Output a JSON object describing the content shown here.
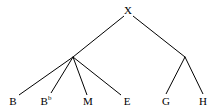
{
  "figure": {
    "type": "cladogram-tree",
    "background_color": "#ffffff",
    "line_color": "#000000",
    "text_color": "#000000",
    "line_width": 1,
    "width": 221,
    "height": 112
  },
  "nodes": {
    "root": {
      "id": "X",
      "label": "X",
      "x": 128,
      "y": 10,
      "labeled": true
    },
    "internal_left": {
      "id": "node-left",
      "label": "",
      "x": 73,
      "y": 57,
      "labeled": false
    },
    "internal_right": {
      "id": "node-right",
      "label": "",
      "x": 185,
      "y": 57,
      "labeled": false
    }
  },
  "leaves": [
    {
      "id": "B",
      "label": "B",
      "superscript": "",
      "x": 13,
      "y": 101
    },
    {
      "id": "Bb",
      "label": "B",
      "superscript": "b",
      "x": 46,
      "y": 101
    },
    {
      "id": "M",
      "label": "M",
      "superscript": "",
      "x": 88,
      "y": 101
    },
    {
      "id": "E",
      "label": "E",
      "superscript": "",
      "x": 127,
      "y": 101
    },
    {
      "id": "G",
      "label": "G",
      "superscript": "",
      "x": 166,
      "y": 101
    },
    {
      "id": "H",
      "label": "H",
      "superscript": "",
      "x": 203,
      "y": 101
    }
  ],
  "edges": [
    {
      "id": "edge-root-left",
      "from": "root",
      "to": "internal_left",
      "x1": 124,
      "y1": 16,
      "x2": 73,
      "y2": 57
    },
    {
      "id": "edge-root-right",
      "from": "root",
      "to": "internal_right",
      "x1": 133,
      "y1": 16,
      "x2": 185,
      "y2": 57
    },
    {
      "id": "edge-left-B",
      "from": "internal_left",
      "to": "B",
      "x1": 73,
      "y1": 57,
      "x2": 19,
      "y2": 95
    },
    {
      "id": "edge-left-Bb",
      "from": "internal_left",
      "to": "Bb",
      "x1": 73,
      "y1": 57,
      "x2": 51,
      "y2": 93
    },
    {
      "id": "edge-left-M",
      "from": "internal_left",
      "to": "M",
      "x1": 73,
      "y1": 57,
      "x2": 87,
      "y2": 95
    },
    {
      "id": "edge-left-E",
      "from": "internal_left",
      "to": "E",
      "x1": 73,
      "y1": 57,
      "x2": 121,
      "y2": 95
    },
    {
      "id": "edge-right-G",
      "from": "internal_right",
      "to": "G",
      "x1": 185,
      "y1": 57,
      "x2": 166,
      "y2": 94
    },
    {
      "id": "edge-right-H",
      "from": "internal_right",
      "to": "H",
      "x1": 185,
      "y1": 57,
      "x2": 203,
      "y2": 94
    }
  ]
}
